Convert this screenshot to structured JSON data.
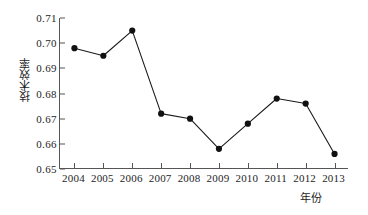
{
  "chart_data": {
    "type": "line",
    "title": "",
    "xlabel": "年份",
    "ylabel": "技术效率",
    "categories": [
      "2004",
      "2005",
      "2006",
      "2007",
      "2008",
      "2009",
      "2010",
      "2011",
      "2012",
      "2013"
    ],
    "values": [
      0.698,
      0.695,
      0.705,
      0.672,
      0.67,
      0.658,
      0.668,
      0.678,
      0.676,
      0.656
    ],
    "series": [
      {
        "name": "技术效率",
        "values": [
          0.698,
          0.695,
          0.705,
          0.672,
          0.67,
          0.658,
          0.668,
          0.678,
          0.676,
          0.656
        ]
      }
    ],
    "ylim": [
      0.65,
      0.71
    ],
    "yticks": [
      "0.65",
      "0.66",
      "0.67",
      "0.68",
      "0.69",
      "0.70",
      "0.71"
    ],
    "ytick_values": [
      0.65,
      0.66,
      0.67,
      0.68,
      0.69,
      0.7,
      0.71
    ],
    "xticks": [
      "2004",
      "2005",
      "2006",
      "2007",
      "2008",
      "2009",
      "2010",
      "2011",
      "2012",
      "2013"
    ],
    "grid": false,
    "legend": "none",
    "line_color": "#1a1a1a",
    "marker_color": "#111111",
    "marker": "circle",
    "axis_color": "#555555",
    "background": "#ffffff"
  }
}
